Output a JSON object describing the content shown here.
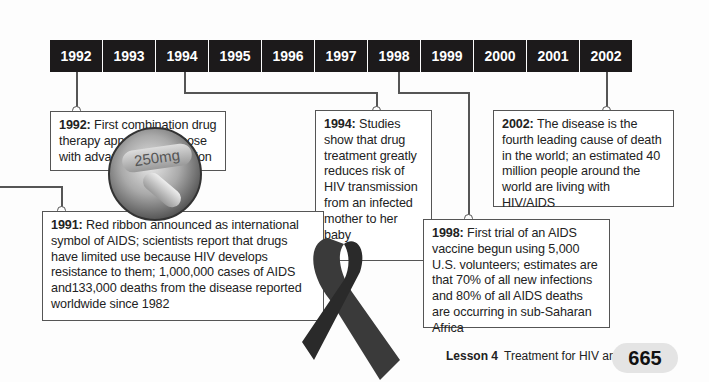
{
  "timeline": {
    "years": [
      "1992",
      "1993",
      "1994",
      "1995",
      "1996",
      "1997",
      "1998",
      "1999",
      "2000",
      "2001",
      "2002"
    ]
  },
  "events": {
    "e1992": {
      "year": "1992:",
      "text": " First combination drug therapy approved for those with advanced HIV infection"
    },
    "e1994": {
      "year": "1994:",
      "text": " Studies show that drug treatment greatly reduces risk of HIV transmission from an infected mother to her baby"
    },
    "e2002": {
      "year": "2002:",
      "text": " The disease is the fourth leading cause of death in the world; an estimated 40 million people around the world are living with HIV/AIDS"
    },
    "e1991": {
      "year": "1991:",
      "text": " Red ribbon announced as international symbol of AIDS; scientists report that drugs have limited use because HIV develops resistance to them; 1,000,000 cases of AIDS and133,000 deaths from the disease reported worldwide since 1982"
    },
    "e1998": {
      "year": "1998:",
      "text": " First trial of an AIDS vaccine begun using 5,000 U.S. volunteers; estimates are that 70% of all new infections and 80% of all AIDS deaths are occurring in sub-Saharan Africa"
    }
  },
  "images": {
    "pill_label": "250mg"
  },
  "footer": {
    "lesson": "Lesson 4",
    "title": "Treatment for HIV and AIDS",
    "page": "665"
  }
}
